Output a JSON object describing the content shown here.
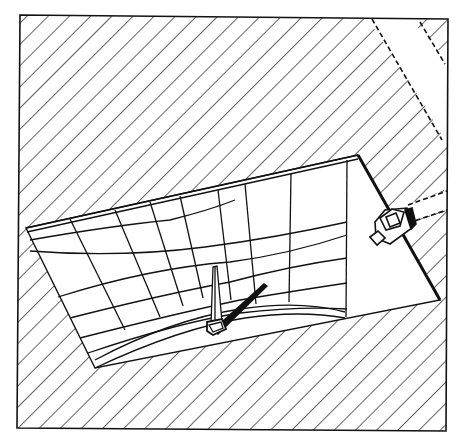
{
  "figure": {
    "title": "Sundial gnomon casting shadow onto curved projection surface with light source",
    "background": "#ffffff",
    "ink": "#111111",
    "frame": {
      "x1": 20,
      "y1": 15,
      "x2": 446,
      "y2": 430
    },
    "plane": {
      "top_left": [
        26,
        228
      ],
      "top_right": [
        358,
        155
      ],
      "bottom_right": [
        440,
        300
      ],
      "bottom_left": [
        95,
        368
      ]
    },
    "hatch_spacing": 15,
    "components": {
      "hatched_ground": "diagonal-hatch-ground",
      "grid_surface": "curved-grid-surface",
      "gnomon": "gnomon-obelisk",
      "shadow": "gnomon-shadow",
      "lamp": "light-source-box",
      "light_beam": "dashed-light-beam"
    }
  }
}
